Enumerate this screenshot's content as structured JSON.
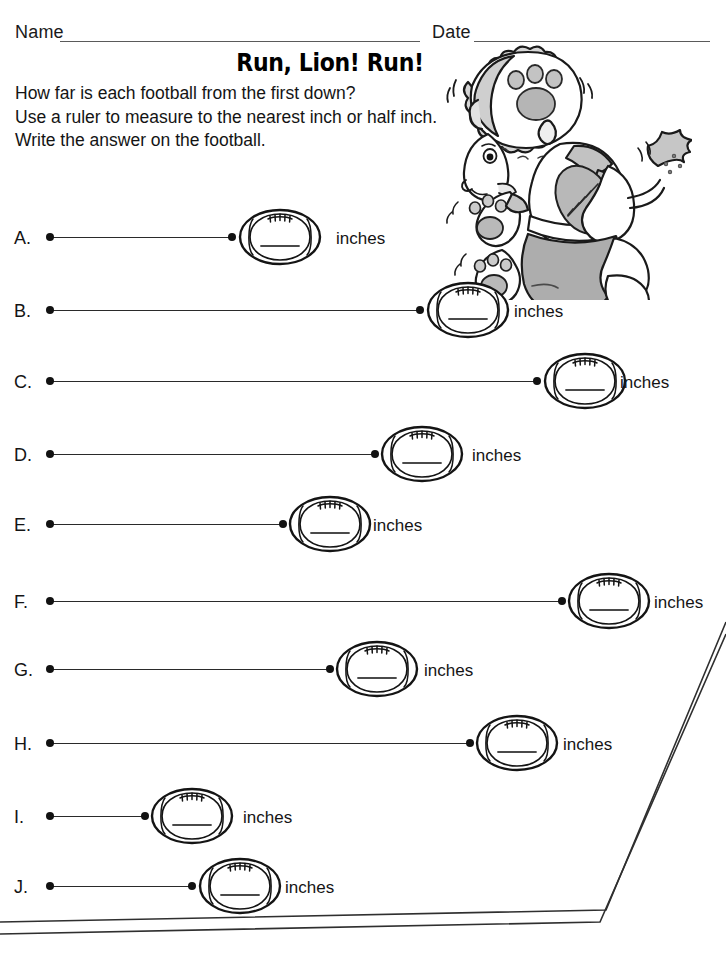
{
  "header": {
    "name_label": "Name",
    "date_label": "Date"
  },
  "title": "Run, Lion! Run!",
  "instructions": [
    "How far is each football from the first down?",
    "Use a ruler to measure to the nearest inch or half inch.",
    "Write the answer on the football."
  ],
  "unit_label": "inches",
  "answer_value": "",
  "colors": {
    "ink": "#141414",
    "rule": "#5a5a5a",
    "line": "#2a2a2a",
    "fur_shade": "#c9c9c9",
    "shade_mid": "#a8a8a8",
    "paper": "#ffffff"
  },
  "problems": [
    {
      "letter": "A.",
      "y": 237,
      "line_start": 50,
      "line_end": 232,
      "ball_x": 236,
      "unit_x": 336,
      "answer": ""
    },
    {
      "letter": "B.",
      "y": 310,
      "line_start": 50,
      "line_end": 420,
      "ball_x": 424,
      "unit_x": 514,
      "answer": ""
    },
    {
      "letter": "C.",
      "y": 381,
      "line_start": 50,
      "line_end": 537,
      "ball_x": 541,
      "unit_x": 620,
      "answer": ""
    },
    {
      "letter": "D.",
      "y": 454,
      "line_start": 50,
      "line_end": 375,
      "ball_x": 378,
      "unit_x": 472,
      "answer": ""
    },
    {
      "letter": "E.",
      "y": 524,
      "line_start": 50,
      "line_end": 283,
      "ball_x": 286,
      "unit_x": 373,
      "answer": ""
    },
    {
      "letter": "F.",
      "y": 601,
      "line_start": 50,
      "line_end": 562,
      "ball_x": 565,
      "unit_x": 654,
      "answer": ""
    },
    {
      "letter": "G.",
      "y": 669,
      "line_start": 50,
      "line_end": 330,
      "ball_x": 333,
      "unit_x": 424,
      "answer": ""
    },
    {
      "letter": "H.",
      "y": 743,
      "line_start": 50,
      "line_end": 470,
      "ball_x": 473,
      "unit_x": 563,
      "answer": ""
    },
    {
      "letter": "I.",
      "y": 816,
      "line_start": 50,
      "line_end": 145,
      "ball_x": 148,
      "unit_x": 243,
      "answer": ""
    },
    {
      "letter": "J.",
      "y": 886,
      "line_start": 50,
      "line_end": 192,
      "ball_x": 196,
      "unit_x": 285,
      "answer": ""
    }
  ],
  "mascot": {
    "name": "running-lion-football-player",
    "description": "Cartoon lion in football helmet and jersey running with a football"
  }
}
